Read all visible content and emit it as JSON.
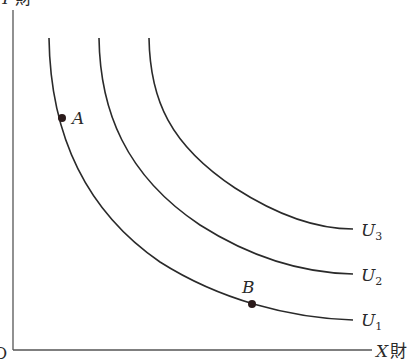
{
  "diagram": {
    "axes": {
      "y_label_var": "Y",
      "y_label_suffix": "財",
      "x_label_var": "X",
      "x_label_suffix": "財",
      "origin_label": "O"
    },
    "curves": [
      {
        "id": "U1",
        "label_main": "U",
        "label_sub": "1"
      },
      {
        "id": "U2",
        "label_main": "U",
        "label_sub": "2"
      },
      {
        "id": "U3",
        "label_main": "U",
        "label_sub": "3"
      }
    ],
    "points": [
      {
        "id": "A",
        "label": "A",
        "on_curve": "U1"
      },
      {
        "id": "B",
        "label": "B",
        "on_curve": "U1"
      }
    ],
    "colors": {
      "line": "#2a2a2a",
      "axis": "#555555",
      "background": "#ffffff"
    }
  }
}
